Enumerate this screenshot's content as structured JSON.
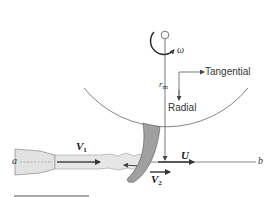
{
  "figure": {
    "colors": {
      "line": "#555555",
      "jet_fill": "#e4e4e4",
      "bucket_fill": "#a0a0a0",
      "arrow": "#333333",
      "scale_bar": "#a8a8a8"
    }
  },
  "labels": {
    "omega": "ω",
    "r_m": "r",
    "r_m_sub": "m",
    "tangential": "Tangential",
    "radial": "Radial",
    "v1": "V",
    "v1_sub": "1",
    "v2": "V",
    "v2_sub": "2",
    "u": "U",
    "a": "a",
    "b": "b"
  }
}
